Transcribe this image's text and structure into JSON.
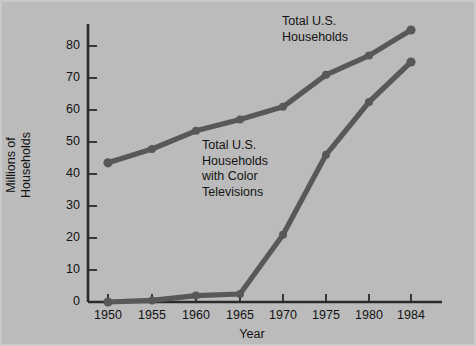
{
  "chart_data": {
    "type": "line",
    "title": "",
    "xlabel": "Year",
    "ylabel": "Millions of Households",
    "ylabel_lines": [
      "Millions of",
      "Households"
    ],
    "categories": [
      "1950",
      "1955",
      "1960",
      "1965",
      "1970",
      "1975",
      "1980",
      "1984"
    ],
    "x": [
      1950,
      1955,
      1960,
      1965,
      1970,
      1975,
      1980,
      1984
    ],
    "ylim": [
      0,
      88
    ],
    "xtick_labels": [
      "1950",
      "1955",
      "1960",
      "1965",
      "1970",
      "1975",
      "1980",
      "1984"
    ],
    "ytick_labels": [
      "0",
      "10",
      "20",
      "30",
      "40",
      "50",
      "60",
      "70",
      "80"
    ],
    "yticks": [
      0,
      10,
      20,
      30,
      40,
      50,
      60,
      70,
      80
    ],
    "grid": false,
    "legend": "annotations",
    "series": [
      {
        "name": "Total U.S. Households",
        "values": [
          43.5,
          47.8,
          53.5,
          57.0,
          61.0,
          71.0,
          77.0,
          85.0
        ],
        "color": "#58585a"
      },
      {
        "name": "Total U.S. Households with Color Televisions",
        "values": [
          0.0,
          0.5,
          2.0,
          2.5,
          21.0,
          46.0,
          62.5,
          75.0
        ],
        "color": "#58585a"
      }
    ],
    "annotations": [
      {
        "id": "total-households",
        "lines": [
          "Total U.S.",
          "Households"
        ]
      },
      {
        "id": "color-televisions",
        "lines": [
          "Total U.S.",
          "Households",
          "with Color",
          "Televisions"
        ]
      }
    ],
    "colors": {
      "background": "#bbbbbb",
      "axis": "#2a2a2a",
      "line": "#58585a",
      "text": "#131313"
    }
  }
}
